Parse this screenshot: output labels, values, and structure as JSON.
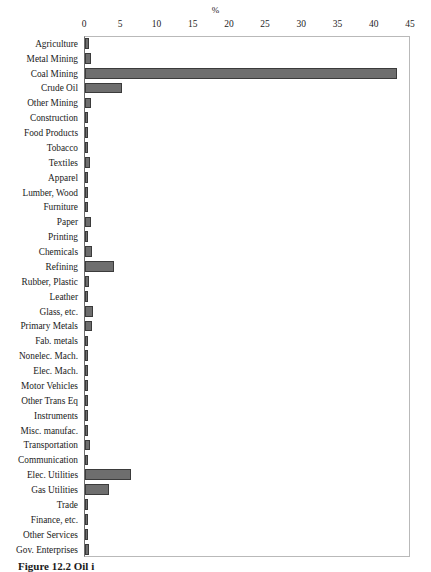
{
  "figure": {
    "caption": "Figure 12.2 Oil i"
  },
  "chart_data": {
    "type": "bar",
    "orientation": "horizontal",
    "title": "%",
    "xlabel": "%",
    "ylabel": "",
    "xlim": [
      0,
      45
    ],
    "xticks": [
      0,
      5,
      10,
      15,
      20,
      25,
      30,
      35,
      40,
      45
    ],
    "grid": false,
    "legend": null,
    "bar_color": "#6e6e6e",
    "bar_edge_color": "#3b3b3b",
    "categories": [
      "Agriculture",
      "Metal Mining",
      "Coal Mining",
      "Crude Oil",
      "Other Mining",
      "Construction",
      "Food Products",
      "Tobacco",
      "Textiles",
      "Apparel",
      "Lumber, Wood",
      "Furniture",
      "Paper",
      "Printing",
      "Chemicals",
      "Refining",
      "Rubber, Plastic",
      "Leather",
      "Glass, etc.",
      "Primary Metals",
      "Fab. metals",
      "Nonelec. Mach.",
      "Elec. Mach.",
      "Motor Vehicles",
      "Other Trans Eq",
      "Instruments",
      "Misc. manufac.",
      "Transportation",
      "Communication",
      "Elec. Utilities",
      "Gas Utilities",
      "Trade",
      "Finance, etc.",
      "Other Services",
      "Gov. Enterprises"
    ],
    "values": [
      0.5,
      0.8,
      43.0,
      5.1,
      0.8,
      0.2,
      0.4,
      0.3,
      0.7,
      0.2,
      0.4,
      0.2,
      0.8,
      0.2,
      0.9,
      4.0,
      0.6,
      0.2,
      1.1,
      1.0,
      0.3,
      0.2,
      0.2,
      0.2,
      0.2,
      0.3,
      0.2,
      0.7,
      0.2,
      6.3,
      3.3,
      0.3,
      0.2,
      0.2,
      0.6
    ]
  }
}
